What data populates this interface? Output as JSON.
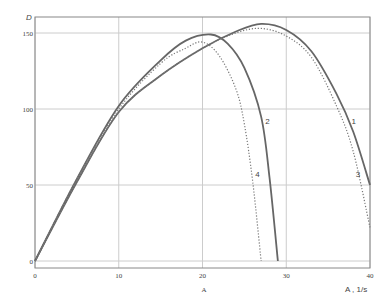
{
  "chart_data": {
    "type": "line",
    "title": "",
    "ylabel": "D",
    "xlabel": "A , 1/s",
    "x_axis_sublabel": "A",
    "xlim": [
      0,
      40
    ],
    "ylim": [
      0,
      160
    ],
    "xticks": [
      0,
      10,
      20,
      30,
      40
    ],
    "yticks": [
      0,
      50,
      100,
      150
    ],
    "grid": true,
    "legend": "inline curve numbers",
    "series": [
      {
        "name": "1",
        "style": "solid",
        "x": [
          0,
          5,
          10,
          15,
          20,
          24,
          27,
          30,
          33,
          36,
          38,
          40
        ],
        "y": [
          0,
          52,
          98,
          122,
          140,
          151,
          156,
          152,
          138,
          110,
          85,
          50
        ]
      },
      {
        "name": "2",
        "style": "solid",
        "x": [
          0,
          5,
          10,
          15,
          18,
          21,
          23,
          25,
          27,
          28,
          29
        ],
        "y": [
          0,
          54,
          102,
          132,
          145,
          149,
          143,
          127,
          95,
          55,
          0
        ]
      },
      {
        "name": "3",
        "style": "dotted",
        "x": [
          0,
          5,
          10,
          15,
          20,
          24,
          27,
          30,
          33,
          36,
          38,
          40
        ],
        "y": [
          0,
          52,
          98,
          122,
          140,
          150,
          153,
          148,
          134,
          102,
          72,
          22
        ]
      },
      {
        "name": "4",
        "style": "dotted",
        "x": [
          0,
          5,
          10,
          15,
          18,
          20,
          22,
          24,
          25,
          26,
          27
        ],
        "y": [
          0,
          54,
          100,
          130,
          140,
          144,
          135,
          113,
          90,
          52,
          0
        ]
      }
    ],
    "curve_labels": [
      {
        "text": "1",
        "x": 37.8,
        "y": 90
      },
      {
        "text": "2",
        "x": 27.5,
        "y": 90
      },
      {
        "text": "3",
        "x": 38.3,
        "y": 55
      },
      {
        "text": "4",
        "x": 26.3,
        "y": 55
      }
    ]
  }
}
